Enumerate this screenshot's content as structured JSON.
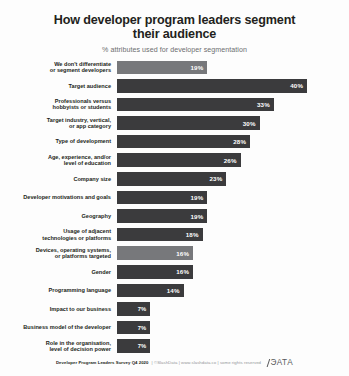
{
  "header": {
    "title": "How developer program leaders\nsegment their audience",
    "subtitle": "% attributes used for developer segmentation"
  },
  "footer": {
    "source": "Developer Program Leaders Survey Q4 2020",
    "meta": "| ©SlashData | www.slashdata.co | some rights reserved",
    "logo_text": "SlashData"
  },
  "colors": {
    "bar_dark": "#3b3b3d",
    "bar_light": "#77787b",
    "text": "#231f20",
    "subtitle": "#6d6e70"
  },
  "chart_data": {
    "type": "bar",
    "orientation": "horizontal",
    "title": "How developer program leaders segment their audience",
    "subtitle": "% attributes used for developer segmentation",
    "xlabel": "",
    "ylabel": "",
    "xlim": [
      0,
      44
    ],
    "grid": false,
    "legend": false,
    "unit": "%",
    "categories": [
      "We don't differentiate\nor segment developers",
      "Target audience",
      "Professionals versus\nhobbyists or students",
      "Target industry, vertical,\nor app category",
      "Type of development",
      "Age, experience, and/or\nlevel of education",
      "Company size",
      "Developer motivations and goals",
      "Geography",
      "Usage of adjacent\ntechnologies or platforms",
      "Devices, operating systems,\nor platforms targeted",
      "Gender",
      "Programming language",
      "Impact to our business",
      "Business model of the developer",
      "Role in the organisation,\nlevel of decision power"
    ],
    "values": [
      19,
      40,
      33,
      30,
      28,
      26,
      23,
      19,
      19,
      18,
      16,
      16,
      14,
      7,
      7,
      7
    ],
    "value_labels": [
      "19%",
      "40%",
      "33%",
      "30%",
      "28%",
      "26%",
      "23%",
      "19%",
      "19%",
      "18%",
      "16%",
      "16%",
      "14%",
      "7%",
      "7%",
      "7%"
    ],
    "bar_shades": [
      "light",
      "dark",
      "dark",
      "dark",
      "dark",
      "dark",
      "dark",
      "dark",
      "dark",
      "dark",
      "light",
      "dark",
      "dark",
      "dark",
      "dark",
      "dark"
    ]
  }
}
